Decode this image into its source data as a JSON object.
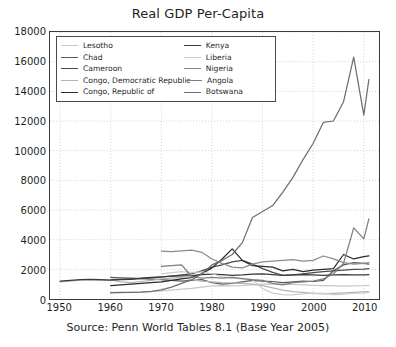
{
  "chart_data": {
    "type": "line",
    "title": "Real GDP Per-Capita",
    "caption": "Source: Penn World Tables 8.1 (Base Year 2005)",
    "xlabel": "",
    "ylabel": "",
    "xlim": [
      1948,
      2013
    ],
    "ylim": [
      0,
      18000
    ],
    "xticks": [
      1950,
      1960,
      1970,
      1980,
      1990,
      2000,
      2010
    ],
    "yticks": [
      0,
      2000,
      4000,
      6000,
      8000,
      10000,
      12000,
      14000,
      16000,
      18000
    ],
    "grid": true,
    "grid_style": "dotted",
    "legend_position": "upper-left",
    "legend_columns": 2,
    "series": [
      {
        "name": "Lesotho",
        "color": "#c8c8c8",
        "x": [
          1960,
          1962,
          1964,
          1966,
          1968,
          1970,
          1972,
          1974,
          1976,
          1978,
          1980,
          1982,
          1984,
          1986,
          1988,
          1990,
          1992,
          1994,
          1996,
          1998,
          2000,
          2002,
          2004,
          2006,
          2008,
          2010,
          2011
        ],
        "values": [
          400,
          420,
          450,
          470,
          500,
          540,
          600,
          660,
          720,
          800,
          880,
          900,
          880,
          900,
          960,
          1000,
          1020,
          1000,
          980,
          950,
          920,
          900,
          880,
          870,
          880,
          900,
          920
        ]
      },
      {
        "name": "Chad",
        "color": "#5a5a5a",
        "x": [
          1960,
          1962,
          1964,
          1966,
          1968,
          1970,
          1972,
          1974,
          1976,
          1978,
          1980,
          1982,
          1984,
          1986,
          1988,
          1990,
          1992,
          1994,
          1996,
          1998,
          2000,
          2002,
          2004,
          2006,
          2008,
          2010,
          2011
        ],
        "values": [
          1450,
          1420,
          1400,
          1380,
          1340,
          1300,
          1250,
          1200,
          1250,
          1300,
          1100,
          1000,
          1050,
          1150,
          1250,
          1200,
          1180,
          1100,
          1150,
          1200,
          1180,
          1250,
          1900,
          2300,
          2450,
          2400,
          2350
        ]
      },
      {
        "name": "Cameroon",
        "color": "#4a4a4a",
        "x": [
          1960,
          1962,
          1964,
          1966,
          1968,
          1970,
          1972,
          1974,
          1976,
          1978,
          1980,
          1982,
          1984,
          1986,
          1988,
          1990,
          1992,
          1994,
          1996,
          1998,
          2000,
          2002,
          2004,
          2006,
          2008,
          2010,
          2011
        ],
        "values": [
          1300,
          1320,
          1350,
          1380,
          1420,
          1480,
          1550,
          1620,
          1700,
          1900,
          2150,
          2300,
          2500,
          2600,
          2350,
          2050,
          1800,
          1600,
          1620,
          1700,
          1780,
          1850,
          1900,
          1950,
          2000,
          2020,
          2050
        ]
      },
      {
        "name": "Congo, Democratic Republic",
        "color": "#b4b4b4",
        "x": [
          1950,
          1952,
          1954,
          1956,
          1958,
          1960,
          1962,
          1964,
          1966,
          1968,
          1970,
          1972,
          1974,
          1976,
          1978,
          1980,
          1982,
          1984,
          1986,
          1988,
          1990,
          1992,
          1994,
          1996,
          1998,
          2000,
          2002,
          2004,
          2006,
          2008,
          2010,
          2011
        ],
        "values": [
          1150,
          1200,
          1280,
          1300,
          1250,
          1280,
          1150,
          1100,
          1180,
          1250,
          1350,
          1400,
          1450,
          1300,
          1200,
          1150,
          1100,
          1080,
          1050,
          1000,
          900,
          750,
          600,
          500,
          450,
          380,
          350,
          380,
          420,
          450,
          480,
          500
        ]
      },
      {
        "name": "Congo, Republic of",
        "color": "#2b2b2b",
        "x": [
          1960,
          1962,
          1964,
          1966,
          1968,
          1970,
          1972,
          1974,
          1976,
          1978,
          1980,
          1982,
          1984,
          1986,
          1988,
          1990,
          1992,
          1994,
          1996,
          1998,
          2000,
          2002,
          2004,
          2006,
          2008,
          2010,
          2011
        ],
        "values": [
          900,
          950,
          1000,
          1050,
          1100,
          1150,
          1250,
          1350,
          1450,
          1700,
          2100,
          2700,
          3380,
          2600,
          2250,
          2200,
          2150,
          1900,
          2000,
          1850,
          1950,
          2000,
          2050,
          3000,
          2700,
          2850,
          2900
        ]
      },
      {
        "name": "Kenya",
        "color": "#3a3a3a",
        "x": [
          1950,
          1952,
          1954,
          1956,
          1958,
          1960,
          1962,
          1964,
          1966,
          1968,
          1970,
          1972,
          1974,
          1976,
          1978,
          1980,
          1982,
          1984,
          1986,
          1988,
          1990,
          1992,
          1994,
          1996,
          1998,
          2000,
          2002,
          2004,
          2006,
          2008,
          2010,
          2011
        ],
        "values": [
          1200,
          1250,
          1300,
          1320,
          1300,
          1280,
          1300,
          1320,
          1400,
          1450,
          1500,
          1550,
          1560,
          1580,
          1650,
          1680,
          1650,
          1600,
          1620,
          1680,
          1700,
          1650,
          1600,
          1620,
          1650,
          1620,
          1600,
          1620,
          1650,
          1620,
          1630,
          1640
        ]
      },
      {
        "name": "Liberia",
        "color": "#cdcdcd",
        "x": [
          1970,
          1972,
          1974,
          1976,
          1978,
          1980,
          1982,
          1984,
          1986,
          1988,
          1990,
          1992,
          1994,
          1996,
          1998,
          2000,
          2002,
          2004,
          2006,
          2008,
          2010,
          2011
        ],
        "values": [
          1700,
          1780,
          1850,
          1800,
          1820,
          1700,
          1500,
          1400,
          1350,
          1300,
          700,
          400,
          300,
          280,
          350,
          400,
          380,
          300,
          320,
          380,
          420,
          450
        ]
      },
      {
        "name": "Nigeria",
        "color": "#8c8c8c",
        "x": [
          1970,
          1972,
          1974,
          1976,
          1978,
          1980,
          1982,
          1984,
          1986,
          1988,
          1990,
          1992,
          1994,
          1996,
          1998,
          2000,
          2002,
          2004,
          2006,
          2008,
          2010,
          2011
        ],
        "values": [
          3230,
          3200,
          3250,
          3300,
          3150,
          2700,
          2400,
          2150,
          2100,
          2350,
          2500,
          2550,
          2600,
          2650,
          2550,
          2600,
          2900,
          2700,
          2450,
          2350,
          2400,
          2450
        ]
      },
      {
        "name": "Angola",
        "color": "#7d7d7d",
        "x": [
          1970,
          1972,
          1974,
          1976,
          1978,
          1980,
          1982,
          1984,
          1986,
          1988,
          1990,
          1992,
          1994,
          1996,
          1998,
          2000,
          2002,
          2004,
          2006,
          2008,
          2010,
          2011
        ],
        "values": [
          2200,
          2250,
          2300,
          1500,
          1400,
          1450,
          1400,
          1450,
          1380,
          1300,
          1250,
          1050,
          950,
          1100,
          1150,
          1200,
          1350,
          1700,
          2400,
          4800,
          4050,
          5400
        ]
      },
      {
        "name": "Botswana",
        "color": "#6e6e6e",
        "x": [
          1960,
          1962,
          1964,
          1966,
          1968,
          1970,
          1972,
          1974,
          1976,
          1978,
          1980,
          1982,
          1984,
          1986,
          1988,
          1990,
          1992,
          1994,
          1996,
          1998,
          2000,
          2002,
          2004,
          2006,
          2008,
          2010,
          2011
        ],
        "values": [
          430,
          440,
          450,
          470,
          520,
          620,
          800,
          1050,
          1300,
          1700,
          2300,
          2600,
          3000,
          3800,
          5500,
          5900,
          6300,
          7200,
          8200,
          9400,
          10500,
          11900,
          12000,
          13300,
          16300,
          12400,
          14800
        ]
      }
    ]
  }
}
